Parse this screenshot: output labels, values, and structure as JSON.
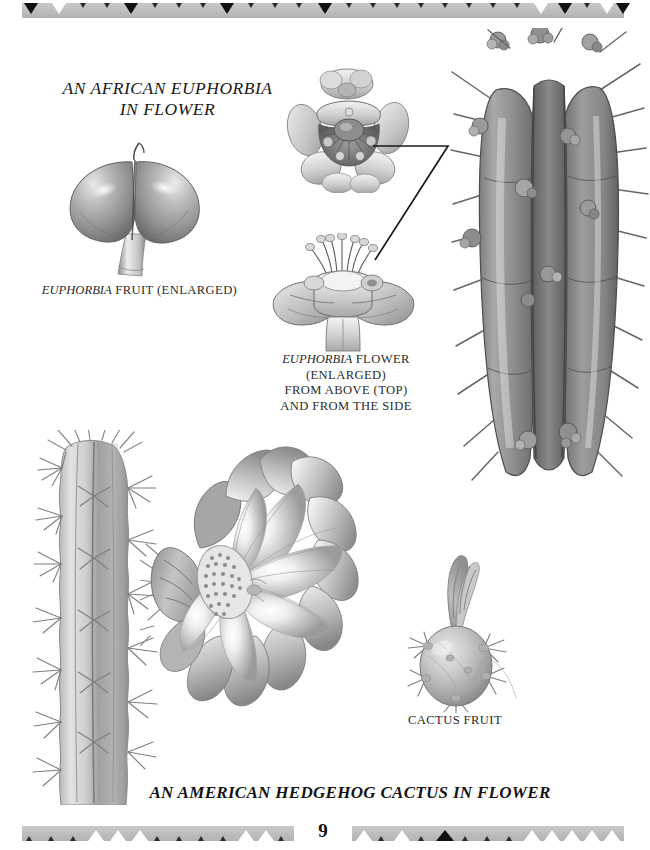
{
  "page": {
    "number": "9",
    "background": "#ffffff",
    "ink": "#231f20"
  },
  "borders": {
    "top": {
      "name": "decorative-border-top",
      "band_color": "#bdbdbd",
      "triangle_direction": "down",
      "triangle_colors": [
        "#111111",
        "#ffffff"
      ]
    },
    "bottom": {
      "name": "decorative-border-bottom",
      "band_color": "#bdbdbd",
      "triangle_direction": "up",
      "triangle_colors": [
        "#ffffff",
        "#111111"
      ]
    }
  },
  "titles": {
    "top": "AN AFRICAN EUPHORBIA\nIN FLOWER",
    "top_line1": "AN AFRICAN EUPHORBIA",
    "top_line2": "IN FLOWER",
    "bottom": "AN AMERICAN HEDGEHOG CACTUS IN FLOWER"
  },
  "captions": {
    "euphorbia_fruit_italic": "EUPHORBIA",
    "euphorbia_fruit_rest": " FRUIT (ENLARGED)",
    "euphorbia_flower_line1_italic": "EUPHORBIA",
    "euphorbia_flower_line1_rest": " FLOWER",
    "euphorbia_flower_line2": "(ENLARGED)",
    "euphorbia_flower_line3": "FROM ABOVE (TOP)",
    "euphorbia_flower_line4": "AND FROM THE SIDE",
    "cactus_fruit": "CACTUS FRUIT"
  },
  "figures": [
    {
      "name": "euphorbia-fruit-illustration",
      "subject": "Euphorbia fruit, bilobed, enlarged",
      "style": "grayscale pencil/wash botanical illustration"
    },
    {
      "name": "euphorbia-flower-top-illustration",
      "subject": "Euphorbia flower viewed from above, enlarged",
      "style": "grayscale pencil/wash botanical illustration"
    },
    {
      "name": "euphorbia-flower-side-illustration",
      "subject": "Euphorbia flower viewed from the side, enlarged",
      "style": "grayscale pencil/wash botanical illustration"
    },
    {
      "name": "euphorbia-stem-illustration",
      "subject": "African euphorbia ribbed spiny stem bearing flowers",
      "style": "grayscale pencil/wash botanical illustration"
    },
    {
      "name": "cactus-stem-illustration",
      "subject": "American hedgehog cactus ribbed columnar stem with spine clusters",
      "style": "grayscale pencil/wash botanical illustration"
    },
    {
      "name": "cactus-flower-illustration",
      "subject": "Hedgehog cactus flower in bloom with many petals and granular stigma",
      "style": "grayscale pencil/wash botanical illustration"
    },
    {
      "name": "cactus-fruit-illustration",
      "subject": "Spiny cactus fruit with withered flower remnant",
      "style": "grayscale pencil/wash botanical illustration"
    }
  ],
  "leader_line": {
    "name": "leader-line-flower-to-stem",
    "color": "#1a1a1a",
    "description": "angled pointer connecting enlarged flower drawings to the stem"
  }
}
